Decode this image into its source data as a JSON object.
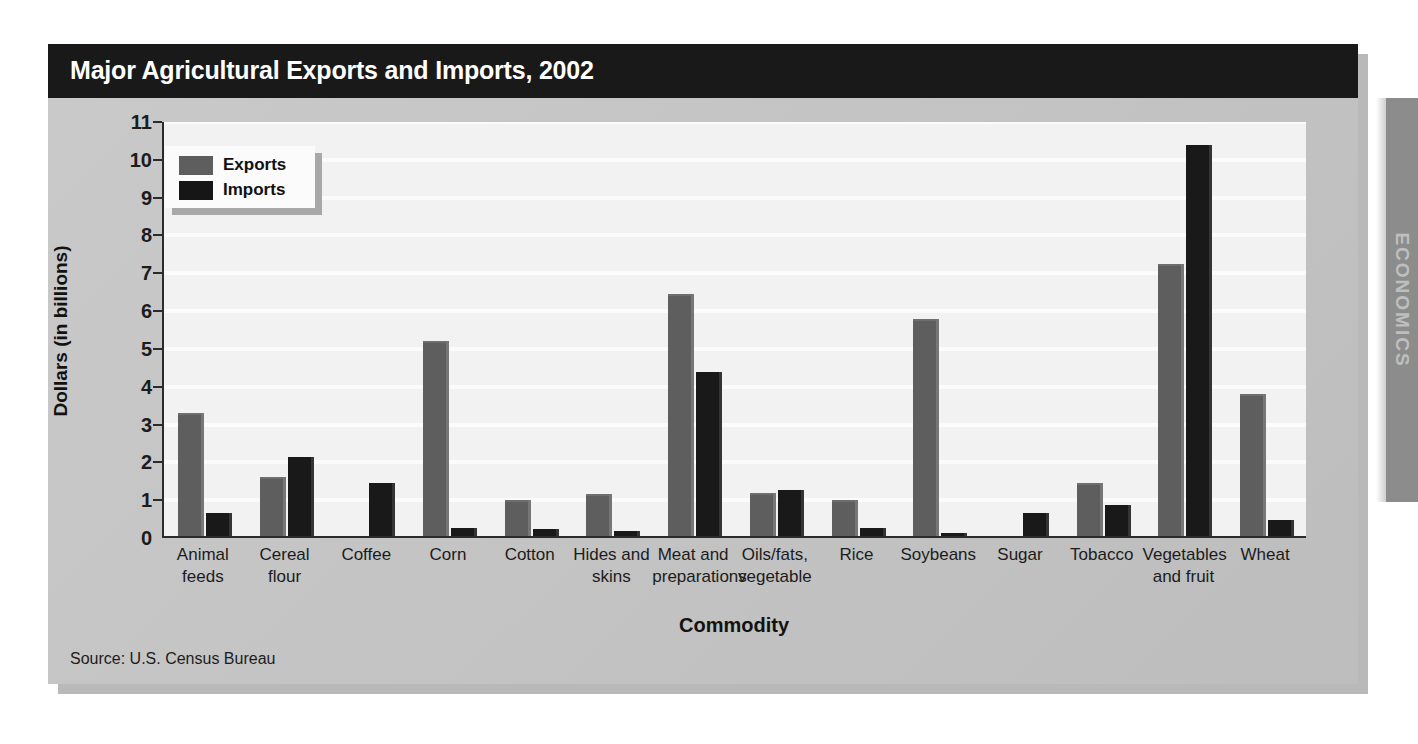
{
  "chart_title": "Major Agricultural Exports and Imports, 2002",
  "source_note": "Source: U.S. Census Bureau",
  "side_tab_label": "ECONOMICS",
  "legend": {
    "items": [
      {
        "label": "Exports",
        "color": "#5e5e5e"
      },
      {
        "label": "Imports",
        "color": "#161616"
      }
    ]
  },
  "chart_data": {
    "type": "bar",
    "title": "Major Agricultural Exports and Imports, 2002",
    "xlabel": "Commodity",
    "ylabel": "Dollars (in billions)",
    "ylim": [
      0,
      11
    ],
    "yticks": [
      0,
      1,
      2,
      3,
      4,
      5,
      6,
      7,
      8,
      9,
      10,
      11
    ],
    "grid": true,
    "legend_position": "upper-left-inside",
    "categories": [
      "Animal feeds",
      "Cereal flour",
      "Coffee",
      "Corn",
      "Cotton",
      "Hides and skins",
      "Meat and preparations",
      "Oils/fats, vegetable",
      "Rice",
      "Soybeans",
      "Sugar",
      "Tobacco",
      "Vegetables and fruit",
      "Wheat"
    ],
    "category_lines": [
      [
        "Animal",
        "feeds"
      ],
      [
        "Cereal",
        "flour"
      ],
      [
        "Coffee",
        ""
      ],
      [
        "Corn",
        ""
      ],
      [
        "Cotton",
        ""
      ],
      [
        "Hides and",
        "skins"
      ],
      [
        "Meat and",
        "preparations"
      ],
      [
        "Oils/fats,",
        "vegetable"
      ],
      [
        "Rice",
        ""
      ],
      [
        "Soybeans",
        ""
      ],
      [
        "Sugar",
        ""
      ],
      [
        "Tobacco",
        ""
      ],
      [
        "Vegetables",
        "and fruit"
      ],
      [
        "Wheat",
        ""
      ]
    ],
    "series": [
      {
        "name": "Exports",
        "color": "#5e5e5e",
        "values": [
          3.25,
          1.55,
          0.0,
          5.15,
          0.95,
          1.1,
          6.4,
          1.15,
          0.95,
          5.75,
          0.0,
          1.4,
          7.2,
          3.75
        ]
      },
      {
        "name": "Imports",
        "color": "#191919",
        "values": [
          0.6,
          2.1,
          1.4,
          0.2,
          0.18,
          0.14,
          4.35,
          1.22,
          0.22,
          0.08,
          0.6,
          0.82,
          10.35,
          0.42
        ]
      }
    ]
  }
}
